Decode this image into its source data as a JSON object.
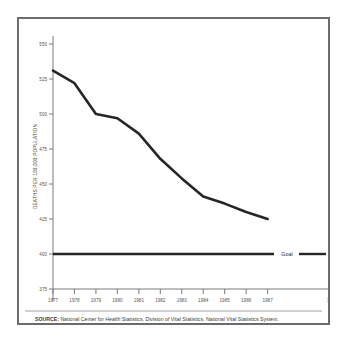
{
  "figure": {
    "frame_color": "#6b6b6b",
    "background": "#ffffff"
  },
  "chart_data": {
    "type": "line",
    "title": "",
    "subtitle": "",
    "xlabel": "",
    "ylabel": "DEATHS PER 100,000 POPULATION",
    "xlim": [
      1977,
      1990
    ],
    "ylim": [
      375,
      550
    ],
    "ytick_labels": [
      "550",
      "525",
      "500",
      "475",
      "450",
      "425",
      "400",
      "375"
    ],
    "ytick_values": [
      550,
      525,
      500,
      475,
      450,
      425,
      400,
      375
    ],
    "xtick_labels": [
      "1977",
      "1978",
      "1979",
      "1980",
      "1981",
      "1982",
      "1983",
      "1984",
      "1985",
      "1986",
      "1987",
      "1990"
    ],
    "xtick_values": [
      1977,
      1978,
      1979,
      1980,
      1981,
      1982,
      1983,
      1984,
      1985,
      1986,
      1987,
      1990
    ],
    "grid": false,
    "legend_position": "inline-right",
    "x": [
      1977,
      1978,
      1979,
      1980,
      1981,
      1982,
      1983,
      1984,
      1985,
      1986,
      1987
    ],
    "series": [
      {
        "name": "Death rate",
        "values": [
          531,
          522,
          500,
          497,
          486,
          468,
          454,
          441,
          436,
          430,
          425
        ]
      }
    ],
    "annotations": [
      {
        "name": "goal-line",
        "label": "Goal",
        "type": "horizontal-line",
        "value": 400
      }
    ],
    "line_color": "#262626",
    "goal_color": "#262626"
  },
  "source": {
    "label": "SOURCE:",
    "text": "National Center for Health Statistics, Division of Vital Statistics, National Vital Statistics System."
  }
}
